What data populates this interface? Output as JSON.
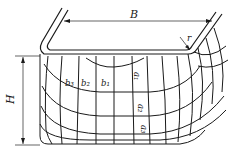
{
  "diagram": {
    "type": "deep-drawn rectangular box with deformation grid",
    "labels": {
      "width": "B",
      "height": "H",
      "corner_radius": "r",
      "b1": "b₁",
      "b2": "b₂",
      "b3": "b₃",
      "a1": "a₁",
      "a2": "a₂",
      "a3": "a₃"
    },
    "colors": {
      "line": "#1a1a1a",
      "background": "#ffffff"
    }
  }
}
